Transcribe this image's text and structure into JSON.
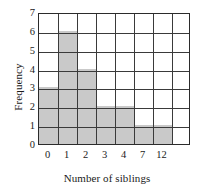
{
  "chart_data": {
    "type": "bar",
    "title": "",
    "xlabel": "Number of siblings",
    "ylabel": "Frequency",
    "categories": [
      "0",
      "1",
      "2",
      "3",
      "4",
      "7",
      "12",
      ""
    ],
    "values": [
      3,
      6,
      4,
      2,
      2,
      1,
      1,
      0
    ],
    "xtick_labels": [
      "0",
      "1",
      "2",
      "3",
      "4",
      "7",
      "12"
    ],
    "ytick_labels": [
      "0",
      "1",
      "2",
      "3",
      "4",
      "5",
      "6",
      "7"
    ],
    "ylim": [
      0,
      7
    ],
    "ystep": 1,
    "grid": true,
    "legend": "none",
    "bar_color": "#c9c9c9",
    "grid_color": "#3a3a3a",
    "axis_color": "#2b2b2b",
    "background_color": "#ffffff"
  }
}
